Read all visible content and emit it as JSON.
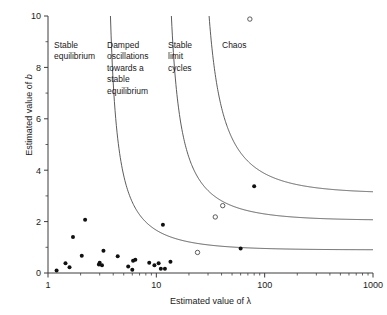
{
  "chart_data": {
    "type": "scatter",
    "title": "",
    "xlabel": "Estimated value of λ",
    "ylabel": "Estimated value of b",
    "xscale": "log",
    "yscale": "linear",
    "xlim": [
      1,
      1000
    ],
    "ylim": [
      0,
      10
    ],
    "grid": false,
    "legend": "none",
    "x_ticks": [
      {
        "value": 1,
        "label": "1"
      },
      {
        "value": 10,
        "label": "10"
      },
      {
        "value": 100,
        "label": "100"
      },
      {
        "value": 1000,
        "label": "1000"
      }
    ],
    "y_ticks": [
      {
        "value": 0,
        "label": "0"
      },
      {
        "value": 1,
        "label": ""
      },
      {
        "value": 2,
        "label": "2"
      },
      {
        "value": 3,
        "label": ""
      },
      {
        "value": 4,
        "label": "4"
      },
      {
        "value": 5,
        "label": ""
      },
      {
        "value": 6,
        "label": "6"
      },
      {
        "value": 7,
        "label": ""
      },
      {
        "value": 8,
        "label": "8"
      },
      {
        "value": 9,
        "label": ""
      },
      {
        "value": 10,
        "label": "10"
      }
    ],
    "annotations": [
      {
        "name": "stable-equilibrium",
        "text": "Stable\nequilibrium",
        "x": 1.55,
        "y": 9.1
      },
      {
        "name": "damped-oscillations",
        "text": "Damped\noscillations\ntowards a\nstable\nequilibrium",
        "x": 4.3,
        "y": 9.1
      },
      {
        "name": "stable-limit-cycles",
        "text": "Stable\nlimit\ncycles",
        "x": 13.5,
        "y": 9.1
      },
      {
        "name": "chaos",
        "text": "Chaos",
        "x": 45.0,
        "y": 9.1
      }
    ],
    "boundaries": [
      {
        "name": "damped-oscillation-boundary",
        "x_asymptote": 3.2,
        "y_asymptote": 0.9,
        "k": 5.2,
        "description": "separates stable equilibrium from damped oscillations"
      },
      {
        "name": "limit-cycle-boundary",
        "x_asymptote": 11.0,
        "y_asymptote": 2.05,
        "k": 22.0,
        "description": "separates damped oscillations from stable limit cycles"
      },
      {
        "name": "chaos-boundary",
        "x_asymptote": 22.0,
        "y_asymptote": 3.1,
        "k": 60.0,
        "description": "separates stable limit cycles from chaos"
      }
    ],
    "series": [
      {
        "name": "Filled points",
        "marker": "filled-circle",
        "color": "#111111",
        "points": [
          [
            1.2,
            0.1
          ],
          [
            1.45,
            0.38
          ],
          [
            1.58,
            0.22
          ],
          [
            1.7,
            1.4
          ],
          [
            2.05,
            0.67
          ],
          [
            2.2,
            2.07
          ],
          [
            2.95,
            0.33
          ],
          [
            3.0,
            0.4
          ],
          [
            3.15,
            0.3
          ],
          [
            3.25,
            0.87
          ],
          [
            4.4,
            0.65
          ],
          [
            5.5,
            0.25
          ],
          [
            6.0,
            0.13
          ],
          [
            6.1,
            0.48
          ],
          [
            6.4,
            0.52
          ],
          [
            8.6,
            0.4
          ],
          [
            9.6,
            0.3
          ],
          [
            10.5,
            0.38
          ],
          [
            11.0,
            0.17
          ],
          [
            11.5,
            1.88
          ],
          [
            12.0,
            0.17
          ],
          [
            13.5,
            0.44
          ],
          [
            60.0,
            0.95
          ],
          [
            80.0,
            3.38
          ]
        ]
      },
      {
        "name": "Open points",
        "marker": "open-circle",
        "color": "#4a4a4a",
        "points": [
          [
            24.0,
            0.8
          ],
          [
            35.0,
            2.18
          ],
          [
            41.0,
            2.62
          ],
          [
            73.0,
            9.88
          ]
        ]
      }
    ]
  },
  "axes": {
    "y_title_prefix": "Estimated value of ",
    "y_title_symbol": "b",
    "x_title": "Estimated value of λ"
  }
}
